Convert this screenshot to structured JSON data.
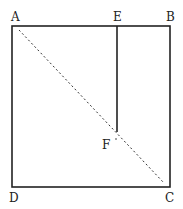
{
  "diagram": {
    "type": "geometric-figure",
    "points": {
      "A": {
        "label": "A",
        "x": 12,
        "y": 26
      },
      "B": {
        "label": "B",
        "x": 170,
        "y": 26
      },
      "C": {
        "label": "C",
        "x": 170,
        "y": 187
      },
      "D": {
        "label": "D",
        "x": 12,
        "y": 187
      },
      "E": {
        "label": "E",
        "x": 117,
        "y": 26
      },
      "F": {
        "label": "F",
        "x": 117,
        "y": 132
      }
    },
    "segments": [
      {
        "from": "A",
        "to": "B",
        "style": "solid"
      },
      {
        "from": "B",
        "to": "C",
        "style": "solid"
      },
      {
        "from": "C",
        "to": "D",
        "style": "solid"
      },
      {
        "from": "D",
        "to": "A",
        "style": "solid"
      },
      {
        "from": "E",
        "to": "F",
        "style": "solid"
      },
      {
        "from": "A",
        "to": "C",
        "style": "dashed"
      }
    ],
    "colors": {
      "line": "#222222",
      "background": "#ffffff"
    }
  }
}
